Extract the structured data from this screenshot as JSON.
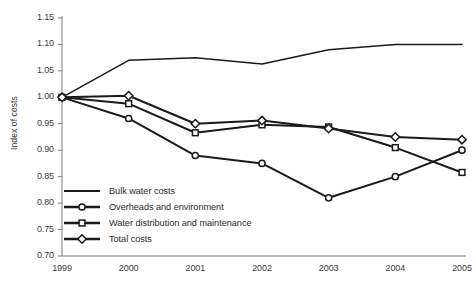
{
  "chart_data": {
    "type": "line",
    "title": "",
    "xlabel": "",
    "ylabel": "Index of costs",
    "categories": [
      "1999",
      "2000",
      "2001",
      "2002",
      "2003",
      "2004",
      "2005"
    ],
    "ylim": [
      0.7,
      1.15
    ],
    "ytick_labels": [
      "1.15",
      "1.10",
      "1.05",
      "1.00",
      "0.95",
      "0.90",
      "0.85",
      "0.80",
      "0.75",
      "0.70"
    ],
    "ytick_values": [
      1.15,
      1.1,
      1.05,
      1.0,
      0.95,
      0.9,
      0.85,
      0.8,
      0.75,
      0.7
    ],
    "grid": false,
    "legend_position": "lower-left-inside",
    "series": [
      {
        "name": "Bulk water costs",
        "marker": "none",
        "color": "#1a1a1a",
        "values": [
          1.0,
          1.07,
          1.075,
          1.063,
          1.09,
          1.1,
          1.1
        ]
      },
      {
        "name": "Overheads and environment",
        "marker": "circle",
        "color": "#1a1a1a",
        "values": [
          1.0,
          0.96,
          0.89,
          0.875,
          0.81,
          0.85,
          0.9
        ]
      },
      {
        "name": "Water distribution and maintenance",
        "marker": "square",
        "color": "#1a1a1a",
        "values": [
          1.0,
          0.988,
          0.933,
          0.948,
          0.944,
          0.905,
          0.858
        ]
      },
      {
        "name": "Total costs",
        "marker": "diamond",
        "color": "#1a1a1a",
        "values": [
          1.0,
          1.003,
          0.95,
          0.956,
          0.941,
          0.925,
          0.92
        ]
      }
    ]
  }
}
